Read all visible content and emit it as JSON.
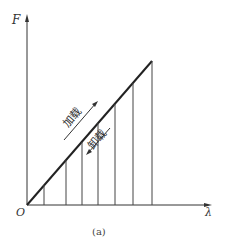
{
  "figure": {
    "y_axis_label": "F",
    "x_axis_label": "λ",
    "origin_label": "O",
    "loading_label": "加载",
    "unloading_label": "卸载",
    "caption": "(a)",
    "line_color": "#222222"
  }
}
